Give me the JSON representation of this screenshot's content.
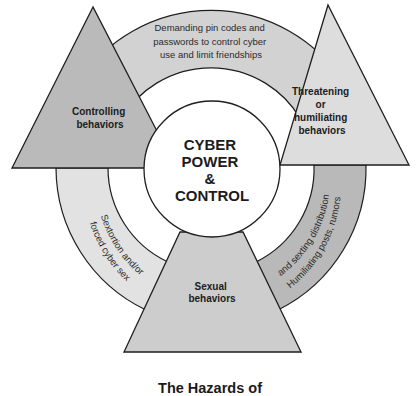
{
  "diagram": {
    "center": {
      "lines": [
        "CYBER",
        "POWER",
        "&",
        "CONTROL"
      ]
    },
    "nodes": [
      {
        "id": "controlling",
        "lines": [
          "Controlling",
          "behaviors"
        ]
      },
      {
        "id": "threatening",
        "lines": [
          "Threatening",
          "or",
          "humiliating",
          "behaviors"
        ]
      },
      {
        "id": "sexual",
        "lines": [
          "Sexual",
          "behaviors"
        ]
      }
    ],
    "ring_segments": [
      {
        "id": "top",
        "lines": [
          "Demanding pin codes and",
          "passwords to control cyber",
          "use and limit friendships"
        ]
      },
      {
        "id": "left",
        "lines": [
          "Sextortion and/or",
          "forced cyber sex"
        ]
      },
      {
        "id": "right",
        "lines": [
          "Humiliating posts, rumors",
          "and sexting distribution"
        ]
      }
    ],
    "caption": "The Hazards of"
  },
  "colors": {
    "ring_top": "#d2d2d2",
    "ring_left": "#e0e0e0",
    "ring_right": "#b8b8b8",
    "triangle_left": "#b9b9b9",
    "triangle_right": "#dcdcdc",
    "trapezoid_bottom": "#cccccc",
    "stroke": "#1e1e1e"
  }
}
